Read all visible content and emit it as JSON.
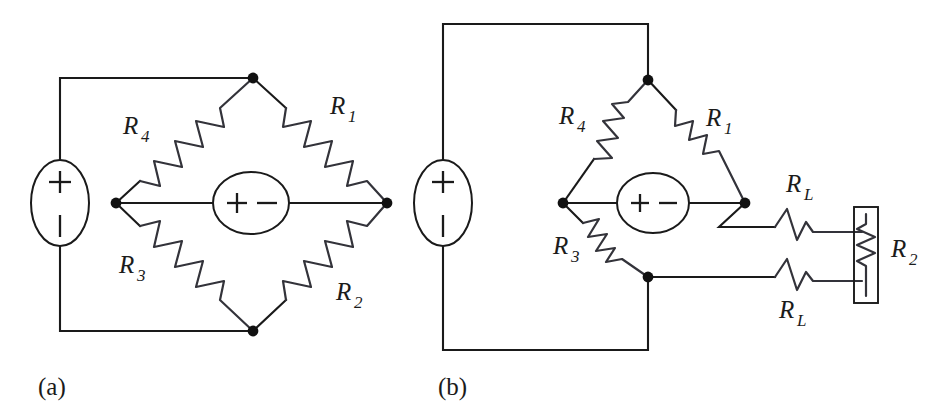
{
  "figure": {
    "stroke_color": "#1a1a1a",
    "background": "#ffffff",
    "panels": [
      {
        "id": "a",
        "caption": "(a)",
        "source": {
          "name": "voltage-source",
          "plus": "+",
          "minus": "−"
        },
        "detector": {
          "name": "bridge-detector-source",
          "plus": "+",
          "minus": "−"
        },
        "resistors": [
          {
            "id": "R1",
            "base": "R",
            "sub": "1",
            "arm": "top-right"
          },
          {
            "id": "R2",
            "base": "R",
            "sub": "2",
            "arm": "bottom-right"
          },
          {
            "id": "R3",
            "base": "R",
            "sub": "3",
            "arm": "bottom-left"
          },
          {
            "id": "R4",
            "base": "R",
            "sub": "4",
            "arm": "top-left"
          }
        ],
        "nodes": 4
      },
      {
        "id": "b",
        "caption": "(b)",
        "source": {
          "name": "voltage-source",
          "plus": "+",
          "minus": "−"
        },
        "detector": {
          "name": "bridge-detector-source",
          "plus": "+",
          "minus": "−"
        },
        "resistors": [
          {
            "id": "R1",
            "base": "R",
            "sub": "1",
            "arm": "top-right"
          },
          {
            "id": "R3",
            "base": "R",
            "sub": "3",
            "arm": "bottom-left"
          },
          {
            "id": "R4",
            "base": "R",
            "sub": "4",
            "arm": "top-left"
          },
          {
            "id": "RL_top",
            "base": "R",
            "sub": "L",
            "arm": "lead-upper"
          },
          {
            "id": "RL_bottom",
            "base": "R",
            "sub": "L",
            "arm": "lead-lower"
          },
          {
            "id": "R2",
            "base": "R",
            "sub": "2",
            "arm": "remote-boxed-element"
          }
        ],
        "nodes": 3
      }
    ]
  }
}
